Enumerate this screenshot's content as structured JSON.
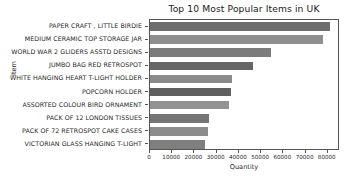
{
  "chart_data": {
    "type": "bar",
    "orientation": "horizontal",
    "title": "Top 10 Most Popular Items in UK",
    "xlabel": "Quantity",
    "ylabel": "Item",
    "categories": [
      "PAPER CRAFT , LITTLE BIRDIE",
      "MEDIUM CERAMIC TOP STORAGE JAR",
      "WORLD WAR 2 GLIDERS ASSTD DESIGNS",
      "JUMBO BAG RED RETROSPOT",
      "WHITE HANGING HEART T-LIGHT HOLDER",
      "POPCORN HOLDER",
      "ASSORTED COLOUR BIRD ORNAMENT",
      "PACK OF 12 LONDON TISSUES",
      "PACK OF 72 RETROSPOT CAKE CASES",
      "VICTORIAN GLASS HANGING T-LIGHT"
    ],
    "values": [
      80995,
      77916,
      54415,
      46181,
      36725,
      36396,
      35362,
      26437,
      26315,
      24866
    ],
    "bar_colors": [
      "#6e6e6e",
      "#8f8f8f",
      "#7c7c7c",
      "#676767",
      "#8b8b8b",
      "#5f5f5f",
      "#929292",
      "#757575",
      "#8c8c8c",
      "#7f7f7f"
    ],
    "xlim": [
      0,
      85500
    ],
    "xticks": [
      0,
      10000,
      20000,
      30000,
      40000,
      50000,
      60000,
      70000,
      80000
    ],
    "xtick_labels": [
      "0",
      "10000",
      "20000",
      "30000",
      "40000",
      "50000",
      "60000",
      "70000",
      "80000"
    ],
    "grid": false,
    "legend": null
  }
}
